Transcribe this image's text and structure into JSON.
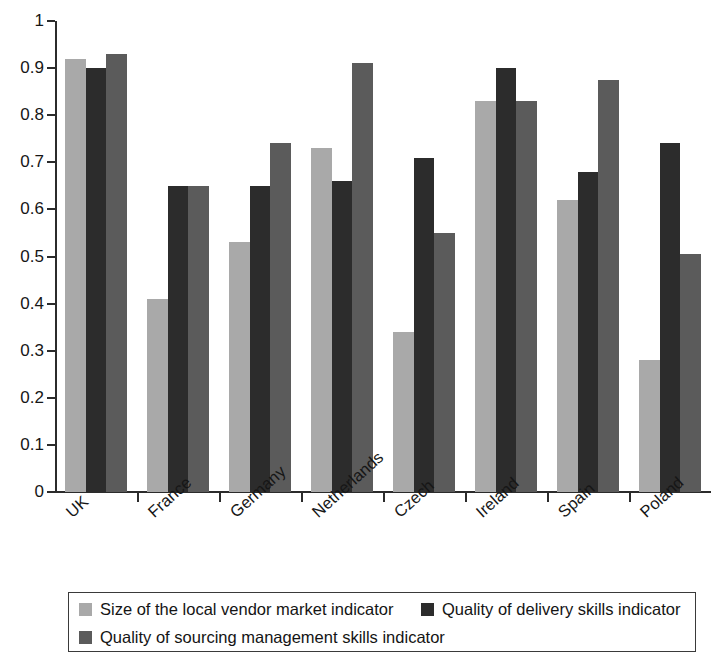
{
  "chart_data": {
    "type": "bar",
    "title": "",
    "subtitle": "",
    "xlabel": "",
    "ylabel": "",
    "ylim": [
      0,
      1
    ],
    "yticks": [
      "0",
      "0.1",
      "0.2",
      "0.3",
      "0.4",
      "0.5",
      "0.6",
      "0.7",
      "0.8",
      "0.9",
      "1"
    ],
    "ytick_values": [
      0,
      0.1,
      0.2,
      0.3,
      0.4,
      0.5,
      0.6,
      0.7,
      0.8,
      0.9,
      1
    ],
    "grid": false,
    "legend_position": "bottom",
    "categories": [
      "UK",
      "France",
      "Germany",
      "Netherlands",
      "Czech",
      "Ireland",
      "Spain",
      "Poland"
    ],
    "series": [
      {
        "name": "Size of the local vendor market indicator",
        "color": "#a9a9a9",
        "values": [
          0.92,
          0.41,
          0.53,
          0.73,
          0.34,
          0.83,
          0.62,
          0.28
        ]
      },
      {
        "name": "Quality of delivery skills indicator",
        "color": "#2c2c2c",
        "values": [
          0.9,
          0.65,
          0.65,
          0.66,
          0.71,
          0.9,
          0.68,
          0.74
        ]
      },
      {
        "name": "Quality of sourcing management skills indicator",
        "color": "#5b5b5b",
        "values": [
          0.93,
          0.65,
          0.74,
          0.91,
          0.55,
          0.83,
          0.875,
          0.505
        ]
      }
    ]
  },
  "axes": {
    "y_ticks": [
      {
        "label": "1",
        "value": 1
      },
      {
        "label": "0.9",
        "value": 0.9
      },
      {
        "label": "0.8",
        "value": 0.8
      },
      {
        "label": "0.7",
        "value": 0.7
      },
      {
        "label": "0.6",
        "value": 0.6
      },
      {
        "label": "0.5",
        "value": 0.5
      },
      {
        "label": "0.4",
        "value": 0.4
      },
      {
        "label": "0.3",
        "value": 0.3
      },
      {
        "label": "0.2",
        "value": 0.2
      },
      {
        "label": "0.1",
        "value": 0.1
      },
      {
        "label": "0",
        "value": 0
      }
    ],
    "x_categories": [
      "UK",
      "France",
      "Germany",
      "Netherlands",
      "Czech",
      "Ireland",
      "Spain",
      "Poland"
    ]
  },
  "legend": {
    "entries": [
      {
        "label": "Size of the local vendor market indicator",
        "color": "#a9a9a9"
      },
      {
        "label": "Quality of delivery skills indicator",
        "color": "#2c2c2c"
      },
      {
        "label": "Quality of sourcing management skills indicator",
        "color": "#5b5b5b"
      }
    ]
  }
}
